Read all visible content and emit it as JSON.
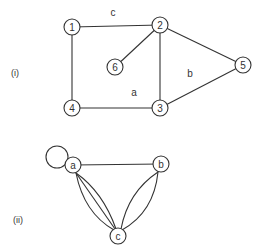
{
  "graph_i": {
    "label": "(i)",
    "nodes": [
      {
        "id": "1",
        "label": "1",
        "x": 72,
        "y": 27
      },
      {
        "id": "2",
        "label": "2",
        "x": 160,
        "y": 25
      },
      {
        "id": "3",
        "label": "3",
        "x": 160,
        "y": 108
      },
      {
        "id": "4",
        "label": "4",
        "x": 72,
        "y": 108
      },
      {
        "id": "5",
        "label": "5",
        "x": 243,
        "y": 65
      },
      {
        "id": "6",
        "label": "6",
        "x": 115,
        "y": 67
      }
    ],
    "edges": [
      [
        "1",
        "2"
      ],
      [
        "1",
        "4"
      ],
      [
        "4",
        "3"
      ],
      [
        "2",
        "3"
      ],
      [
        "2",
        "6"
      ],
      [
        "2",
        "5"
      ],
      [
        "3",
        "5"
      ]
    ],
    "face_labels": [
      {
        "label": "c",
        "x": 113,
        "y": 14
      },
      {
        "label": "a",
        "x": 134,
        "y": 94
      },
      {
        "label": "b",
        "x": 190,
        "y": 75
      }
    ]
  },
  "graph_ii": {
    "label": "(ii)",
    "nodes": [
      {
        "id": "a",
        "label": "a",
        "x": 73,
        "y": 165
      },
      {
        "id": "b",
        "label": "b",
        "x": 161,
        "y": 164
      },
      {
        "id": "c",
        "label": "c",
        "x": 118,
        "y": 236
      }
    ],
    "edges": [
      {
        "from": "a",
        "to": "a",
        "type": "loop"
      },
      {
        "from": "a",
        "to": "b",
        "count": 1
      },
      {
        "from": "a",
        "to": "c",
        "count": 3
      },
      {
        "from": "b",
        "to": "c",
        "count": 2
      }
    ]
  }
}
